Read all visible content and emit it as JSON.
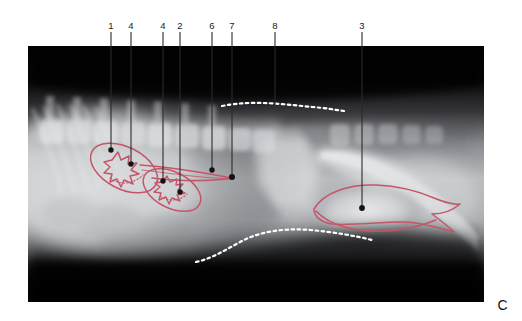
{
  "figure": {
    "panel_letter": "C",
    "modality": "radiograph",
    "view": "lateral abdomen",
    "image_area": {
      "x": 28,
      "y": 46,
      "width": 456,
      "height": 256
    },
    "background_color": "#ffffff",
    "film_color": "#050505",
    "annotation_color": "#c4566a",
    "leader_color": "#2b2b2b",
    "contour_color": "#ffffff"
  },
  "annotations": {
    "leaders": [
      {
        "id": "leader-1",
        "label": "1",
        "label_x": 111,
        "label_y": 26,
        "line_x": 111,
        "line_y1": 32,
        "line_y2": 150,
        "dot_x": 111,
        "dot_y": 150
      },
      {
        "id": "leader-4a",
        "label": "4",
        "label_x": 131,
        "label_y": 26,
        "line_x": 131,
        "line_y1": 32,
        "line_y2": 164,
        "dot_x": 131,
        "dot_y": 164
      },
      {
        "id": "leader-4b",
        "label": "4",
        "label_x": 163,
        "label_y": 26,
        "line_x": 163,
        "line_y1": 32,
        "line_y2": 181,
        "dot_x": 163,
        "dot_y": 181
      },
      {
        "id": "leader-2",
        "label": "2",
        "label_x": 180,
        "label_y": 26,
        "line_x": 180,
        "line_y1": 32,
        "line_y2": 192,
        "dot_x": 180,
        "dot_y": 192
      },
      {
        "id": "leader-6",
        "label": "6",
        "label_x": 212,
        "label_y": 26,
        "line_x": 212,
        "line_y1": 32,
        "line_y2": 170,
        "dot_x": 212,
        "dot_y": 170
      },
      {
        "id": "leader-7",
        "label": "7",
        "label_x": 232,
        "label_y": 26,
        "line_x": 232,
        "line_y1": 32,
        "line_y2": 177,
        "dot_x": 232,
        "dot_y": 177
      },
      {
        "id": "leader-8",
        "label": "8",
        "label_x": 275,
        "label_y": 26,
        "line_x": 275,
        "line_y1": 32,
        "line_y2": 107,
        "dot_x": 275,
        "dot_y": 107
      },
      {
        "id": "leader-3",
        "label": "3",
        "label_x": 362,
        "label_y": 26,
        "line_x": 362,
        "line_y1": 32,
        "line_y2": 208,
        "dot_x": 362,
        "dot_y": 208
      }
    ]
  }
}
